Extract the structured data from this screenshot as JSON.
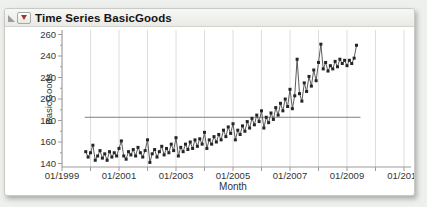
{
  "panel": {
    "title": "Time Series BasicGoods"
  },
  "icons": {
    "disclosure": "open-disclosure-triangle",
    "menu": "red-triangle-menu"
  },
  "colors": {
    "red_triangle": "#a5342d",
    "disclosure_gray": "#9a9a9a",
    "marker": "#252525",
    "series_line": "#4a4a4a",
    "grid": "#dedede",
    "axis": "#9c9c9c",
    "reference_line": "#7f7f7f",
    "tick_text": "#333333"
  },
  "chart_data": {
    "type": "line",
    "title": "Time Series BasicGoods",
    "xlabel": "Month",
    "ylabel": "BasicGoods",
    "legend": "none",
    "grid": "vertical-only",
    "x_tick_labels": [
      "01/1999",
      "01/2001",
      "01/2003",
      "01/2005",
      "01/2007",
      "01/2009",
      "01/2011"
    ],
    "x_tick_years": [
      1999,
      2001,
      2003,
      2005,
      2007,
      2009,
      2011
    ],
    "x_gridline_year_min": 1999,
    "x_gridline_year_max": 2011,
    "y_ticks": [
      140,
      160,
      180,
      200,
      220,
      240,
      260
    ],
    "y_minor_step": 10,
    "ylim": [
      136.5,
      264
    ],
    "xlim_years": [
      1998.95,
      2011.3
    ],
    "reference_line_value": 183,
    "series_start": {
      "year": 1999,
      "month": 11
    },
    "interval": "monthly",
    "values": [
      151,
      146,
      150,
      157,
      143,
      147,
      152,
      145,
      149,
      143,
      151,
      146,
      150,
      147,
      154,
      161,
      147,
      144,
      151,
      148,
      153,
      147,
      155,
      150,
      146,
      152,
      162,
      141,
      149,
      153,
      146,
      151,
      156,
      148,
      154,
      150,
      158,
      152,
      164,
      147,
      155,
      151,
      158,
      153,
      160,
      154,
      162,
      156,
      163,
      158,
      169,
      154,
      162,
      158,
      165,
      160,
      167,
      162,
      171,
      165,
      174,
      168,
      177,
      162,
      171,
      167,
      175,
      170,
      179,
      173,
      182,
      176,
      185,
      179,
      189,
      173,
      183,
      178,
      187,
      181,
      192,
      185,
      196,
      189,
      200,
      193,
      209,
      191,
      203,
      237,
      205,
      198,
      215,
      207,
      221,
      212,
      227,
      217,
      234,
      251,
      228,
      234,
      226,
      231,
      228,
      235,
      230,
      237,
      233,
      236,
      231,
      236,
      233,
      238,
      250
    ]
  }
}
